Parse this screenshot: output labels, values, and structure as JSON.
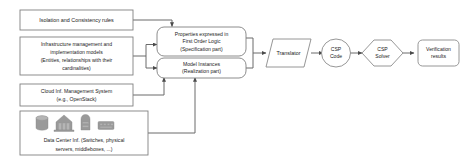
{
  "diagram": {
    "colors": {
      "background": "#ffffff",
      "box_border": "#808080",
      "connector": "#6b6b6b",
      "text": "#1a1a1a",
      "icon": "#9a9a9a"
    },
    "inputs": [
      {
        "id": "isolation-consistency-rules",
        "shape": "rectangle",
        "lines": [
          "Isolation and Consistency rules"
        ]
      },
      {
        "id": "infrastructure-models",
        "shape": "rectangle",
        "lines": [
          "Infrastructure management and",
          "implementation models",
          "(Entities, relationships with their",
          "cardinalities)"
        ]
      },
      {
        "id": "cloud-management-system",
        "shape": "rectangle",
        "lines": [
          "Cloud Inf. Management System",
          "(e.g., OpenStack)"
        ]
      },
      {
        "id": "data-center-infrastructure",
        "shape": "rectangle",
        "lines": [
          "Data Center Inf. (Switches, physical",
          "servers, middleboxes, ...)"
        ],
        "icons": [
          "storage-cylinder-icon",
          "server-cluster-icon",
          "server-unit-icon",
          "network-switch-icon"
        ]
      }
    ],
    "intermediates": [
      {
        "id": "properties-first-order-logic",
        "shape": "rounded-rectangle",
        "lines": [
          "Properties expressed in",
          "First Order Logic",
          "(Specification part)"
        ]
      },
      {
        "id": "model-instances",
        "shape": "rounded-rectangle",
        "lines": [
          "Model Instances",
          "(Realization part)"
        ]
      }
    ],
    "pipeline": [
      {
        "id": "translator",
        "shape": "parallelogram",
        "lines": [
          "Translator"
        ]
      },
      {
        "id": "csp-code",
        "shape": "ellipse",
        "lines": [
          "CSP",
          "Code"
        ]
      },
      {
        "id": "csp-solver",
        "shape": "hexagon",
        "lines": [
          "CSP",
          "Solver"
        ]
      },
      {
        "id": "verification-results",
        "shape": "rounded-rectangle",
        "lines": [
          "Verification",
          "results"
        ]
      }
    ],
    "edges": [
      {
        "from": "isolation-consistency-rules",
        "to": "properties-first-order-logic"
      },
      {
        "from": "infrastructure-models",
        "to": "properties-first-order-logic"
      },
      {
        "from": "infrastructure-models",
        "to": "model-instances"
      },
      {
        "from": "cloud-management-system",
        "to": "model-instances"
      },
      {
        "from": "data-center-infrastructure",
        "to": "model-instances"
      },
      {
        "from": "properties-first-order-logic",
        "to": "translator"
      },
      {
        "from": "model-instances",
        "to": "translator"
      },
      {
        "from": "translator",
        "to": "csp-code"
      },
      {
        "from": "csp-code",
        "to": "csp-solver"
      },
      {
        "from": "csp-solver",
        "to": "verification-results"
      }
    ]
  }
}
